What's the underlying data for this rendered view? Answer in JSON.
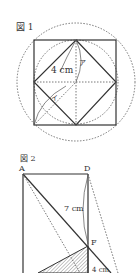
{
  "figure1": {
    "title": "図 1",
    "length_label": "4 cm",
    "label_a": "ア",
    "label_i": "イ"
  },
  "figure2": {
    "title": "図 2",
    "vertex_a": "A",
    "vertex_d": "D",
    "vertex_f": "F",
    "length_label": "7 cm",
    "bottom_label": "4 cm"
  },
  "colors": {
    "line": "#333333",
    "dotted": "#555555"
  }
}
